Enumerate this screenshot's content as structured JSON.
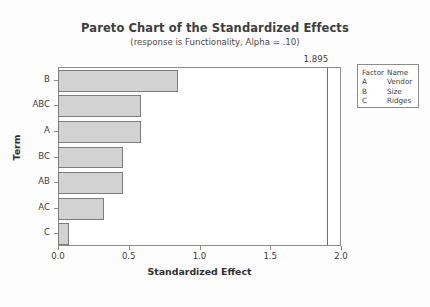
{
  "chart_data": {
    "type": "bar",
    "orientation": "horizontal",
    "title": "Pareto Chart of the Standardized Effects",
    "subtitle": "(response is Functionality, Alpha = .10)",
    "xlabel": "Standardized Effect",
    "ylabel": "Term",
    "categories": [
      "B",
      "ABC",
      "A",
      "BC",
      "AB",
      "AC",
      "C"
    ],
    "values": [
      0.84,
      0.58,
      0.58,
      0.45,
      0.45,
      0.32,
      0.07
    ],
    "xlim": [
      0.0,
      2.0
    ],
    "xticks": [
      "0.0",
      "0.5",
      "1.0",
      "1.5",
      "2.0"
    ],
    "xtick_values": [
      0.0,
      0.5,
      1.0,
      1.5,
      2.0
    ],
    "grid": false,
    "legend_position": "right",
    "reference_line": {
      "value": 1.895,
      "label": "1.895"
    },
    "bar_fill_color": "#d2d2d2",
    "bar_border_color": "#7d7d7d",
    "axis_color": "#8c8c8c"
  },
  "legend": {
    "headers": {
      "factor": "Factor",
      "name": "Name"
    },
    "rows": [
      {
        "factor": "A",
        "name": "Vendor"
      },
      {
        "factor": "B",
        "name": "Size"
      },
      {
        "factor": "C",
        "name": "Ridges"
      }
    ]
  }
}
